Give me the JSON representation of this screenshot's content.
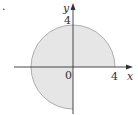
{
  "figure": {
    "marker": ".",
    "x_axis_label": "x",
    "y_axis_label": "y",
    "origin_label": "0",
    "x_tick_label": "4",
    "y_tick_label": "4",
    "region": {
      "description": "Disk of radius 4 centered at origin, excluding the fourth quadrant (x>0, y<0)",
      "radius": 4,
      "fill_color": "#e6e6e6",
      "edge_color": "#9a9a9a"
    },
    "axis_color": "#333333"
  }
}
